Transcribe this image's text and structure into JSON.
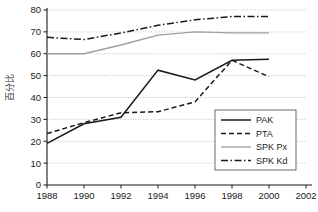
{
  "chart_data": {
    "type": "line",
    "title": "",
    "xlabel": "",
    "ylabel": "百分比",
    "xlim": [
      1988,
      2002
    ],
    "ylim": [
      0,
      80
    ],
    "x": [
      1988,
      1990,
      1992,
      1994,
      1996,
      1998,
      2000
    ],
    "xticks": [
      "1988",
      "1990",
      "1992",
      "1994",
      "1996",
      "1998",
      "2000",
      "2002"
    ],
    "xtick_values": [
      1988,
      1990,
      1992,
      1994,
      1996,
      1998,
      2000,
      2002
    ],
    "yticks": [
      "0",
      "10",
      "20",
      "30",
      "40",
      "50",
      "60",
      "70",
      "80"
    ],
    "ytick_values": [
      0,
      10,
      20,
      30,
      40,
      50,
      60,
      70,
      80
    ],
    "grid": true,
    "grid_axis": "y",
    "legend_position": "lower right",
    "series": [
      {
        "name": "PAK",
        "style": "solid",
        "color": "#1a1a1a",
        "width": 1.5,
        "dasharray": "",
        "values": [
          19.0,
          28.0,
          31.0,
          52.5,
          48.0,
          57.0,
          57.5
        ]
      },
      {
        "name": "PTA",
        "style": "dashed",
        "color": "#1a1a1a",
        "width": 1.5,
        "dasharray": "5 3",
        "values": [
          23.5,
          28.5,
          33.0,
          33.5,
          38.0,
          57.0,
          49.5
        ]
      },
      {
        "name": "SPK Px",
        "style": "solid-light",
        "color": "#9e9e9e",
        "width": 1.3,
        "dasharray": "",
        "values": [
          60.0,
          60.0,
          64.0,
          68.5,
          70.0,
          69.5,
          69.5
        ]
      },
      {
        "name": "SPK Kd",
        "style": "dash-dot",
        "color": "#1a1a1a",
        "width": 1.5,
        "dasharray": "7 2.5 1.5 2.5",
        "values": [
          67.5,
          66.5,
          69.5,
          73.0,
          75.5,
          77.0,
          77.0
        ]
      }
    ]
  },
  "legend": {
    "entries": [
      {
        "label": "PAK"
      },
      {
        "label": "PTA"
      },
      {
        "label": "SPK Px"
      },
      {
        "label": "SPK Kd"
      }
    ]
  },
  "axis": {
    "y_title": "百分比"
  }
}
